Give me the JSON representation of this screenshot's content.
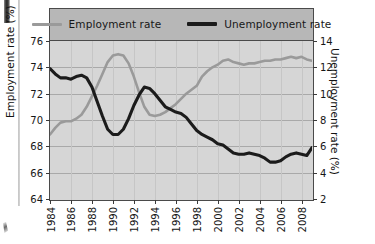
{
  "chart_data": {
    "type": "line",
    "title": "",
    "xlabel": "",
    "ylabel": "Employment rate (%)",
    "y2label": "Unemployment rate (%)",
    "grid": true,
    "legend_position": "top",
    "xlim": [
      1984,
      2009
    ],
    "ylim": [
      64,
      76
    ],
    "y2lim": [
      2,
      14
    ],
    "xticks": [
      "1984",
      "1986",
      "1988",
      "1990",
      "1992",
      "1994",
      "1996",
      "1998",
      "2000",
      "2002",
      "2004",
      "2006",
      "2008"
    ],
    "yticks": [
      "64",
      "66",
      "68",
      "70",
      "72",
      "74",
      "76"
    ],
    "y2ticks": [
      "2",
      "4",
      "6",
      "8",
      "10",
      "12",
      "14"
    ],
    "series": [
      {
        "name": "Employment rate",
        "axis": "left",
        "color": "#9a9a9a",
        "unit": "%",
        "x": [
          1984.0,
          1984.5,
          1985.0,
          1985.5,
          1986.0,
          1986.5,
          1987.0,
          1987.5,
          1988.0,
          1988.5,
          1989.0,
          1989.5,
          1990.0,
          1990.5,
          1991.0,
          1991.5,
          1992.0,
          1992.5,
          1993.0,
          1993.5,
          1994.0,
          1994.5,
          1995.0,
          1995.5,
          1996.0,
          1996.5,
          1997.0,
          1997.5,
          1998.0,
          1998.5,
          1999.0,
          1999.5,
          2000.0,
          2000.5,
          2001.0,
          2001.5,
          2002.0,
          2002.5,
          2003.0,
          2003.5,
          2004.0,
          2004.5,
          2005.0,
          2005.5,
          2006.0,
          2006.5,
          2007.0,
          2007.5,
          2008.0,
          2008.5,
          2009.0
        ],
        "values": [
          68.9,
          69.4,
          69.8,
          69.9,
          69.9,
          70.1,
          70.4,
          71.0,
          71.8,
          72.6,
          73.5,
          74.4,
          74.9,
          75.0,
          74.9,
          74.3,
          73.3,
          72.1,
          71.0,
          70.4,
          70.3,
          70.4,
          70.6,
          70.9,
          71.2,
          71.6,
          72.0,
          72.3,
          72.6,
          73.3,
          73.7,
          74.0,
          74.2,
          74.5,
          74.6,
          74.4,
          74.3,
          74.2,
          74.3,
          74.3,
          74.4,
          74.5,
          74.5,
          74.6,
          74.6,
          74.7,
          74.8,
          74.7,
          74.8,
          74.6,
          74.5
        ]
      },
      {
        "name": "Unemployment rate",
        "axis": "right",
        "color": "#1b1b1b",
        "unit": "%",
        "x": [
          1984.0,
          1984.5,
          1985.0,
          1985.5,
          1986.0,
          1986.5,
          1987.0,
          1987.5,
          1988.0,
          1988.5,
          1989.0,
          1989.5,
          1990.0,
          1990.5,
          1991.0,
          1991.5,
          1992.0,
          1992.5,
          1993.0,
          1993.5,
          1994.0,
          1994.5,
          1995.0,
          1995.5,
          1996.0,
          1996.5,
          1997.0,
          1997.5,
          1998.0,
          1998.5,
          1999.0,
          1999.5,
          2000.0,
          2000.5,
          2001.0,
          2001.5,
          2002.0,
          2002.5,
          2003.0,
          2003.5,
          2004.0,
          2004.5,
          2005.0,
          2005.5,
          2006.0,
          2006.5,
          2007.0,
          2007.5,
          2008.0,
          2008.5,
          2009.0
        ],
        "values": [
          11.9,
          11.5,
          11.2,
          11.2,
          11.1,
          11.3,
          11.4,
          11.2,
          10.5,
          9.4,
          8.3,
          7.3,
          6.9,
          6.9,
          7.3,
          8.1,
          9.1,
          9.9,
          10.5,
          10.4,
          10.0,
          9.5,
          9.0,
          8.8,
          8.6,
          8.5,
          8.2,
          7.7,
          7.2,
          6.9,
          6.7,
          6.5,
          6.2,
          6.1,
          5.8,
          5.5,
          5.4,
          5.4,
          5.5,
          5.4,
          5.3,
          5.1,
          4.8,
          4.8,
          4.9,
          5.2,
          5.4,
          5.5,
          5.4,
          5.3,
          5.9
        ]
      }
    ],
    "annotations": []
  },
  "legend": {
    "items": [
      {
        "label": "Employment rate",
        "style": "light-line"
      },
      {
        "label": "Unemployment rate",
        "style": "dark-line"
      }
    ]
  },
  "axes": {
    "left_title": "Employment rate (%)",
    "right_title": "Unemployment rate (%)"
  },
  "colors": {
    "employment_line": "#9a9a9a",
    "unemployment_line": "#1b1b1b",
    "plot_background": "#d6d6d6",
    "legend_background": "#b7b7b7",
    "frame": "#4a4a4a",
    "gridline": "#a9a9a9",
    "page_background": "#ffffff"
  }
}
